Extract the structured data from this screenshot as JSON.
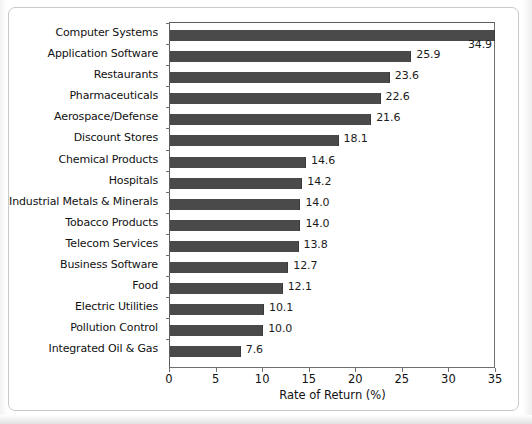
{
  "chart_data": {
    "type": "bar",
    "orientation": "horizontal",
    "title": "",
    "xlabel": "Rate of Return (%)",
    "ylabel": "",
    "xlim": [
      0,
      35
    ],
    "xticks": [
      0,
      5,
      10,
      15,
      20,
      25,
      30,
      35
    ],
    "xtick_labels": [
      "0",
      "5",
      "10",
      "15",
      "20",
      "25",
      "30",
      "35"
    ],
    "grid": false,
    "legend": false,
    "bar_color": "#4a4a4a",
    "categories": [
      "Computer Systems",
      "Application Software",
      "Restaurants",
      "Pharmaceuticals",
      "Aerospace/Defense",
      "Discount Stores",
      "Chemical Products",
      "Hospitals",
      "Industrial Metals & Minerals",
      "Tobacco Products",
      "Telecom Services",
      "Business Software",
      "Food",
      "Electric Utilities",
      "Pollution Control",
      "Integrated Oil & Gas"
    ],
    "values": [
      34.9,
      25.9,
      23.6,
      22.6,
      21.6,
      18.1,
      14.6,
      14.2,
      14.0,
      14.0,
      13.8,
      12.7,
      12.1,
      10.1,
      10.0,
      7.6
    ],
    "value_labels": [
      "34.9",
      "25.9",
      "23.6",
      "22.6",
      "21.6",
      "18.1",
      "14.6",
      "14.2",
      "14.0",
      "14.0",
      "13.8",
      "12.7",
      "12.1",
      "10.1",
      "10.0",
      "7.6"
    ]
  }
}
